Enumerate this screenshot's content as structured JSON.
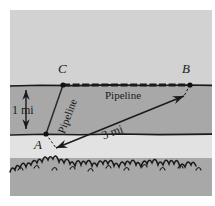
{
  "figure": {
    "colors": {
      "page_background": "#ffffff",
      "upper_region": "#d2d2d2",
      "strip_region": "#a8a8a8",
      "lower_clear_region": "#e2e2e2",
      "brush_region": "#a8a8a8",
      "ink": "#1a1a1a"
    },
    "points": [
      {
        "id": "A",
        "label": "A",
        "x": 46,
        "y": 134,
        "label_x": 36,
        "label_y": 141
      },
      {
        "id": "B",
        "label": "B",
        "x": 190,
        "y": 85,
        "label_x": 183,
        "label_y": 64
      },
      {
        "id": "C",
        "label": "C",
        "x": 63,
        "y": 85,
        "label_x": 59,
        "label_y": 64
      }
    ],
    "labels": {
      "vertical_distance": "1 mi",
      "diagonal_distance": "3 mi",
      "pipeline_horizontal": "Pipeline",
      "pipeline_diagonal": "Pipeline"
    },
    "segments": [
      {
        "name": "upper-boundary",
        "from": "left-edge",
        "to": "right-edge",
        "y": 85,
        "style": "solid-irregular"
      },
      {
        "name": "lower-boundary",
        "from": "left-edge",
        "to": "right-edge",
        "y": 134,
        "style": "solid-irregular"
      },
      {
        "name": "pipeline-CB",
        "from": "C",
        "to": "B",
        "style": "dashed-hatched"
      },
      {
        "name": "pipeline-AC",
        "from": "A",
        "to": "C",
        "style": "solid"
      },
      {
        "name": "distance-AB",
        "from": "A",
        "to": "B",
        "style": "double-arrow",
        "value": "3 mi"
      },
      {
        "name": "distance-strip-width",
        "style": "double-arrow-vertical",
        "value": "1 mi",
        "x": 25,
        "y_top": 85,
        "y_bottom": 134
      }
    ]
  }
}
